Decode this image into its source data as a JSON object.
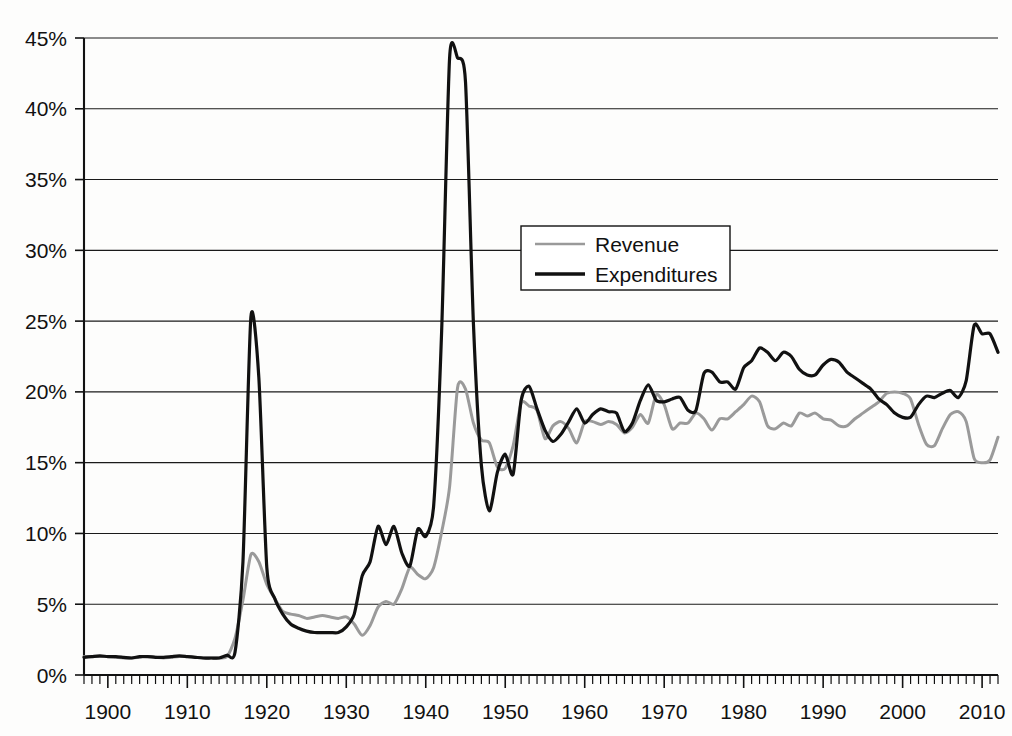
{
  "chart_data": {
    "type": "line",
    "title": "",
    "subtitle": "",
    "xlabel": "",
    "ylabel": "",
    "xlim": [
      1897,
      2012
    ],
    "ylim": [
      0,
      45
    ],
    "grid": true,
    "grid_axis": "y",
    "legend_position": "upper-center",
    "ytick_labels": [
      "0%",
      "5%",
      "10%",
      "15%",
      "20%",
      "25%",
      "30%",
      "35%",
      "40%",
      "45%"
    ],
    "ytick_values": [
      0,
      5,
      10,
      15,
      20,
      25,
      30,
      35,
      40,
      45
    ],
    "xtick_labels": [
      "1900",
      "1910",
      "1920",
      "1930",
      "1940",
      "1950",
      "1960",
      "1970",
      "1980",
      "1990",
      "2000",
      "2010"
    ],
    "xtick_values": [
      1900,
      1910,
      1920,
      1930,
      1940,
      1950,
      1960,
      1970,
      1980,
      1990,
      2000,
      2010
    ],
    "minor_tick_step": 2,
    "colors": {
      "revenue": "#9a9a9a",
      "expenditures": "#111111",
      "gridline": "#1a1a1a",
      "axis": "#111111",
      "background": "#fdfdfc"
    },
    "series": [
      {
        "name": "Revenue",
        "color": "#9a9a9a",
        "stroke_width": 3.0,
        "x": [
          1897,
          1898,
          1899,
          1900,
          1901,
          1902,
          1903,
          1904,
          1905,
          1906,
          1907,
          1908,
          1909,
          1910,
          1911,
          1912,
          1913,
          1914,
          1915,
          1916,
          1917,
          1918,
          1919,
          1920,
          1921,
          1922,
          1923,
          1924,
          1925,
          1926,
          1927,
          1928,
          1929,
          1930,
          1931,
          1932,
          1933,
          1934,
          1935,
          1936,
          1937,
          1938,
          1939,
          1940,
          1941,
          1942,
          1943,
          1944,
          1945,
          1946,
          1947,
          1948,
          1949,
          1950,
          1951,
          1952,
          1953,
          1954,
          1955,
          1956,
          1957,
          1958,
          1959,
          1960,
          1961,
          1962,
          1963,
          1964,
          1965,
          1966,
          1967,
          1968,
          1969,
          1970,
          1971,
          1972,
          1973,
          1974,
          1975,
          1976,
          1977,
          1978,
          1979,
          1980,
          1981,
          1982,
          1983,
          1984,
          1985,
          1986,
          1987,
          1988,
          1989,
          1990,
          1991,
          1992,
          1993,
          1994,
          1995,
          1996,
          1997,
          1998,
          1999,
          2000,
          2001,
          2002,
          2003,
          2004,
          2005,
          2006,
          2007,
          2008,
          2009,
          2010,
          2011,
          2012
        ],
        "y": [
          1.3,
          1.3,
          1.3,
          1.3,
          1.25,
          1.2,
          1.2,
          1.25,
          1.3,
          1.25,
          1.2,
          1.25,
          1.3,
          1.3,
          1.25,
          1.2,
          1.2,
          1.2,
          1.3,
          2.6,
          5.3,
          8.5,
          8.0,
          6.4,
          5.4,
          4.5,
          4.3,
          4.2,
          4.0,
          4.1,
          4.2,
          4.1,
          4.0,
          4.1,
          3.6,
          2.8,
          3.5,
          4.8,
          5.2,
          5.0,
          6.1,
          7.6,
          7.1,
          6.8,
          7.6,
          10.1,
          13.3,
          20.3,
          20.2,
          17.8,
          16.6,
          16.4,
          14.7,
          14.6,
          16.2,
          19.2,
          19.0,
          18.7,
          16.7,
          17.6,
          17.9,
          17.4,
          16.4,
          17.9,
          17.9,
          17.7,
          17.9,
          17.7,
          17.1,
          17.5,
          18.4,
          17.8,
          19.8,
          19.1,
          17.4,
          17.8,
          17.8,
          18.5,
          18.1,
          17.3,
          18.1,
          18.1,
          18.6,
          19.1,
          19.7,
          19.3,
          17.6,
          17.4,
          17.8,
          17.6,
          18.5,
          18.3,
          18.5,
          18.1,
          18.0,
          17.6,
          17.6,
          18.1,
          18.5,
          18.9,
          19.3,
          19.9,
          20.0,
          19.9,
          19.5,
          17.7,
          16.3,
          16.2,
          17.4,
          18.4,
          18.6,
          17.9,
          15.3,
          15.0,
          15.2,
          16.8
        ]
      },
      {
        "name": "Expenditures",
        "color": "#111111",
        "stroke_width": 3.2,
        "x": [
          1897,
          1898,
          1899,
          1900,
          1901,
          1902,
          1903,
          1904,
          1905,
          1906,
          1907,
          1908,
          1909,
          1910,
          1911,
          1912,
          1913,
          1914,
          1915,
          1916,
          1917,
          1918,
          1919,
          1920,
          1921,
          1922,
          1923,
          1924,
          1925,
          1926,
          1927,
          1928,
          1929,
          1930,
          1931,
          1932,
          1933,
          1934,
          1935,
          1936,
          1937,
          1938,
          1939,
          1940,
          1941,
          1942,
          1943,
          1944,
          1945,
          1946,
          1947,
          1948,
          1949,
          1950,
          1951,
          1952,
          1953,
          1954,
          1955,
          1956,
          1957,
          1958,
          1959,
          1960,
          1961,
          1962,
          1963,
          1964,
          1965,
          1966,
          1967,
          1968,
          1969,
          1970,
          1971,
          1972,
          1973,
          1974,
          1975,
          1976,
          1977,
          1978,
          1979,
          1980,
          1981,
          1982,
          1983,
          1984,
          1985,
          1986,
          1987,
          1988,
          1989,
          1990,
          1991,
          1992,
          1993,
          1994,
          1995,
          1996,
          1997,
          1998,
          1999,
          2000,
          2001,
          2002,
          2003,
          2004,
          2005,
          2006,
          2007,
          2008,
          2009,
          2010,
          2011,
          2012
        ],
        "y": [
          1.25,
          1.3,
          1.35,
          1.3,
          1.3,
          1.25,
          1.2,
          1.3,
          1.3,
          1.25,
          1.25,
          1.3,
          1.35,
          1.3,
          1.25,
          1.2,
          1.2,
          1.2,
          1.4,
          1.6,
          8.0,
          25.3,
          21.0,
          7.6,
          5.4,
          4.3,
          3.6,
          3.3,
          3.1,
          3.0,
          3.0,
          3.0,
          3.0,
          3.4,
          4.3,
          7.0,
          8.0,
          10.5,
          9.2,
          10.5,
          8.6,
          7.7,
          10.3,
          9.8,
          12.0,
          24.3,
          43.6,
          43.6,
          41.9,
          24.8,
          14.8,
          11.6,
          14.3,
          15.6,
          14.2,
          19.4,
          20.4,
          18.8,
          17.3,
          16.5,
          17.0,
          17.9,
          18.8,
          17.8,
          18.4,
          18.8,
          18.6,
          18.5,
          17.2,
          17.8,
          19.4,
          20.5,
          19.4,
          19.3,
          19.5,
          19.6,
          18.7,
          18.7,
          21.3,
          21.4,
          20.7,
          20.7,
          20.2,
          21.7,
          22.2,
          23.1,
          22.8,
          22.2,
          22.8,
          22.5,
          21.6,
          21.2,
          21.2,
          21.9,
          22.3,
          22.1,
          21.4,
          21.0,
          20.6,
          20.2,
          19.5,
          19.1,
          18.5,
          18.2,
          18.2,
          19.1,
          19.7,
          19.6,
          19.9,
          20.1,
          19.6,
          20.8,
          24.7,
          24.1,
          24.1,
          22.8
        ]
      }
    ],
    "annotations": {
      "wwi_peak": {
        "year": 1918,
        "value": 25.3,
        "series": "Expenditures"
      },
      "wwii_peak": {
        "year": 1943,
        "value": 43.6,
        "series": "Expenditures"
      },
      "wwii_revenue_peak": {
        "year": 1944,
        "value": 20.3,
        "series": "Revenue"
      },
      "reagan_peak": {
        "year": 1983,
        "value": 23.1,
        "series": "Expenditures"
      },
      "dotcom_revenue_peak": {
        "year": 2000,
        "value": 20.0,
        "series": "Revenue"
      },
      "great_recession_peak": {
        "year": 2009,
        "value": 24.7,
        "series": "Expenditures"
      },
      "great_recession_revenue_low": {
        "year": 2009,
        "value": 15.0,
        "series": "Revenue"
      }
    }
  },
  "legend": {
    "items": [
      {
        "label": "Revenue",
        "color": "#9a9a9a"
      },
      {
        "label": "Expenditures",
        "color": "#111111"
      }
    ]
  }
}
